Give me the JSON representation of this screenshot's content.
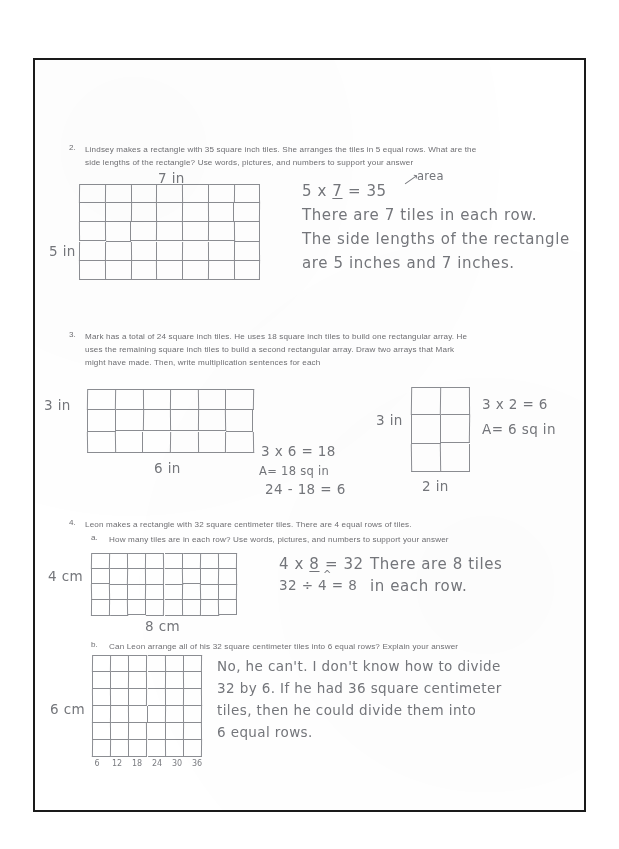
{
  "document": {
    "type": "scanned-math-worksheet",
    "ink_color": "#74767b",
    "print_color": "#6e6e72",
    "border_color": "#1a1a1a"
  },
  "questions": [
    {
      "number": "2.",
      "line1": "Lindsey makes a rectangle with 35 square inch tiles.  She arranges the tiles in 5 equal rows.  What are the",
      "line2": "side lengths of the rectangle?  Use words, pictures, and numbers to support your answer",
      "grid": {
        "cols": 7,
        "rows": 5,
        "top_label": "7 in",
        "left_label": "5 in"
      },
      "work": {
        "equation_prefix": "5 x ",
        "equation_blank": "7",
        "equation_suffix": " = 35",
        "annotation": "area",
        "sentence_line1": "There are 7 tiles in each row.",
        "sentence_line2": "The side lengths of the rectangle",
        "sentence_line3": "are 5 inches and 7 inches."
      }
    },
    {
      "number": "3.",
      "line1": "Mark has a total of 24 square inch tiles.  He uses 18 square inch tiles to build one rectangular array.  He",
      "line2": "uses the remaining square inch tiles to build a second rectangular array.  Draw two arrays that Mark",
      "line3": "might have made.  Then, write multiplication sentences for each",
      "array_a": {
        "cols": 6,
        "rows": 3,
        "left_label": "3 in",
        "bottom_label": "6 in",
        "work_line1": "3 x 6 = 18",
        "work_line2": "A= 18 sq in",
        "work_line3": "24 - 18 = 6"
      },
      "array_b": {
        "cols": 2,
        "rows": 3,
        "left_label": "3 in",
        "bottom_label": "2 in",
        "work_line1": "3 x 2 = 6",
        "work_line2": "A= 6 sq in"
      }
    },
    {
      "number": "4.",
      "line1": "Leon makes a rectangle with 32 square centimeter tiles.  There are 4 equal rows of tiles.",
      "part_a": {
        "letter": "a.",
        "prompt": "How many tiles are in each row? Use words, pictures, and numbers to support your answer",
        "grid": {
          "cols": 8,
          "rows": 4,
          "left_label": "4 cm",
          "bottom_label": "8 cm"
        },
        "work": {
          "equation_prefix": "4 x ",
          "equation_blank": "8",
          "equation_suffix": " = 32",
          "division_line": "32 ÷ 4 = 8",
          "sentence_line1": "There are 8 tiles",
          "sentence_line2": "in each row."
        }
      },
      "part_b": {
        "letter": "b.",
        "prompt": "Can Leon arrange all of his 32 square centimeter tiles into 6 equal rows?  Explain your answer",
        "grid": {
          "cols": 6,
          "rows": 6,
          "left_label": "6 cm",
          "bottom_ticks": [
            "6",
            "12",
            "18",
            "24",
            "30",
            "36"
          ]
        },
        "work": {
          "line1": "No, he can't. I don't know how to divide",
          "line2": "32 by 6. If he had 36 square centimeter",
          "line3": "tiles, then he could divide them into",
          "line4": "6 equal rows."
        }
      }
    }
  ]
}
